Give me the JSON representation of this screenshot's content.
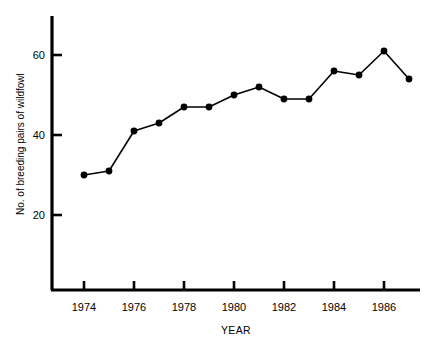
{
  "chart_data": {
    "type": "line",
    "title": "",
    "xlabel": "YEAR",
    "ylabel": "No. of breeding pairs of wildfowl",
    "x": [
      1974,
      1975,
      1976,
      1977,
      1978,
      1979,
      1980,
      1981,
      1982,
      1983,
      1984,
      1985,
      1986,
      1987
    ],
    "values": [
      30,
      31,
      41,
      43,
      47,
      47,
      50,
      52,
      49,
      49,
      56,
      55,
      61,
      54
    ],
    "series": [
      {
        "name": "Breeding pairs of wildfowl",
        "values": [
          30,
          31,
          41,
          43,
          47,
          47,
          50,
          52,
          49,
          49,
          56,
          55,
          61,
          54
        ]
      }
    ],
    "xlim": [
      1973.3,
      1987.5
    ],
    "ylim": [
      0,
      68
    ],
    "xticks": [
      1974,
      1976,
      1978,
      1980,
      1982,
      1984,
      1986
    ],
    "xtick_labels": [
      "1974",
      "1976",
      "1978",
      "1980",
      "1982",
      "1984",
      "1986"
    ],
    "yticks": [
      20,
      40,
      60
    ],
    "ytick_labels": [
      "20",
      "40",
      "60"
    ],
    "grid": false,
    "legend": false,
    "marker": "filled-circle",
    "line_color": "#000000",
    "marker_color": "#000000",
    "background_color": "#ffffff"
  },
  "axes": {
    "x_axis_title": "YEAR",
    "y_axis_title": "No. of breeding pairs of wildfowl"
  }
}
